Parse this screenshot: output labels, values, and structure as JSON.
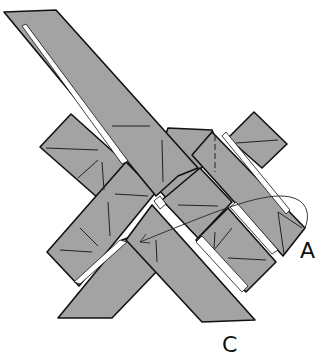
{
  "diagram": {
    "type": "origami-folding-step",
    "labels": {
      "a": "A",
      "c": "C"
    },
    "colors": {
      "paper": "#a3a3a3",
      "outline": "#111111",
      "background": "#ffffff"
    },
    "arrow": {
      "description": "curved arrow from corner A tucking under toward center-left"
    }
  }
}
